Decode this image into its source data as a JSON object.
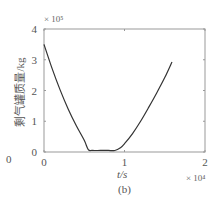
{
  "chart_data": {
    "type": "line",
    "title": "",
    "subtitle": "(b)",
    "xlabel": "t/s",
    "ylabel": "剩气罐质量/kg",
    "x_multiplier": "× 10⁴",
    "y_multiplier": "× 10⁵",
    "xlim": [
      0,
      2
    ],
    "ylim": [
      0,
      4
    ],
    "x_ticks": [
      "0",
      "1",
      "2"
    ],
    "y_ticks": [
      "0",
      "1",
      "2",
      "3",
      "4"
    ],
    "grid": false,
    "legend": null,
    "series": [
      {
        "name": "mass",
        "color": "#333333",
        "x": [
          0,
          0.1,
          0.2,
          0.3,
          0.4,
          0.5,
          0.55,
          0.6,
          0.7,
          0.8,
          0.88,
          0.95,
          1.0,
          1.1,
          1.2,
          1.3,
          1.4,
          1.5,
          1.59
        ],
        "y": [
          3.5,
          2.72,
          2.02,
          1.4,
          0.86,
          0.38,
          0.08,
          0.05,
          0.05,
          0.05,
          0.05,
          0.14,
          0.27,
          0.6,
          1.0,
          1.45,
          1.92,
          2.42,
          2.93
        ]
      }
    ]
  },
  "labels": {
    "x_axis": "t/s",
    "y_axis": "剩气罐质量/kg",
    "x_multiplier": "× 10⁴",
    "y_multiplier": "× 10⁵",
    "caption": "(b)",
    "origin_extra": "0"
  }
}
